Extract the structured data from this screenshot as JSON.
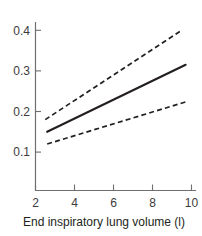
{
  "chart_data": {
    "type": "line",
    "title": "",
    "subtitle": "",
    "xlabel": "End inspiratory lung volume (l)",
    "ylabel": "",
    "xlim": [
      2,
      10
    ],
    "ylim": [
      0.05,
      0.44
    ],
    "xticks": [
      2,
      4,
      6,
      8,
      10
    ],
    "xticklabels": [
      "2",
      "4",
      "6",
      "8",
      "10"
    ],
    "yticks": [
      0.1,
      0.2,
      0.3,
      0.4
    ],
    "yticklabels": [
      "0.1",
      "0.2",
      "0.3",
      "0.4"
    ],
    "grid": false,
    "legend": null,
    "annotations": [],
    "series": [
      {
        "name": "upper confidence limit",
        "style": "dashed",
        "color": "#231f20",
        "x": [
          2.5,
          9.5
        ],
        "values": [
          0.18,
          0.4
        ]
      },
      {
        "name": "fitted mean",
        "style": "solid",
        "color": "#231f20",
        "x": [
          2.6,
          9.7
        ],
        "values": [
          0.15,
          0.315
        ]
      },
      {
        "name": "lower confidence limit",
        "style": "dashed",
        "color": "#231f20",
        "x": [
          2.6,
          9.8
        ],
        "values": [
          0.12,
          0.225
        ]
      }
    ]
  },
  "axis": {
    "x_title": "End inspiratory lung volume (l)",
    "y_title": ""
  },
  "colors": {
    "background": "#ffffff",
    "axis": "#6f6f6f",
    "data": "#231f20",
    "tick_label": "#3b3b3b"
  }
}
